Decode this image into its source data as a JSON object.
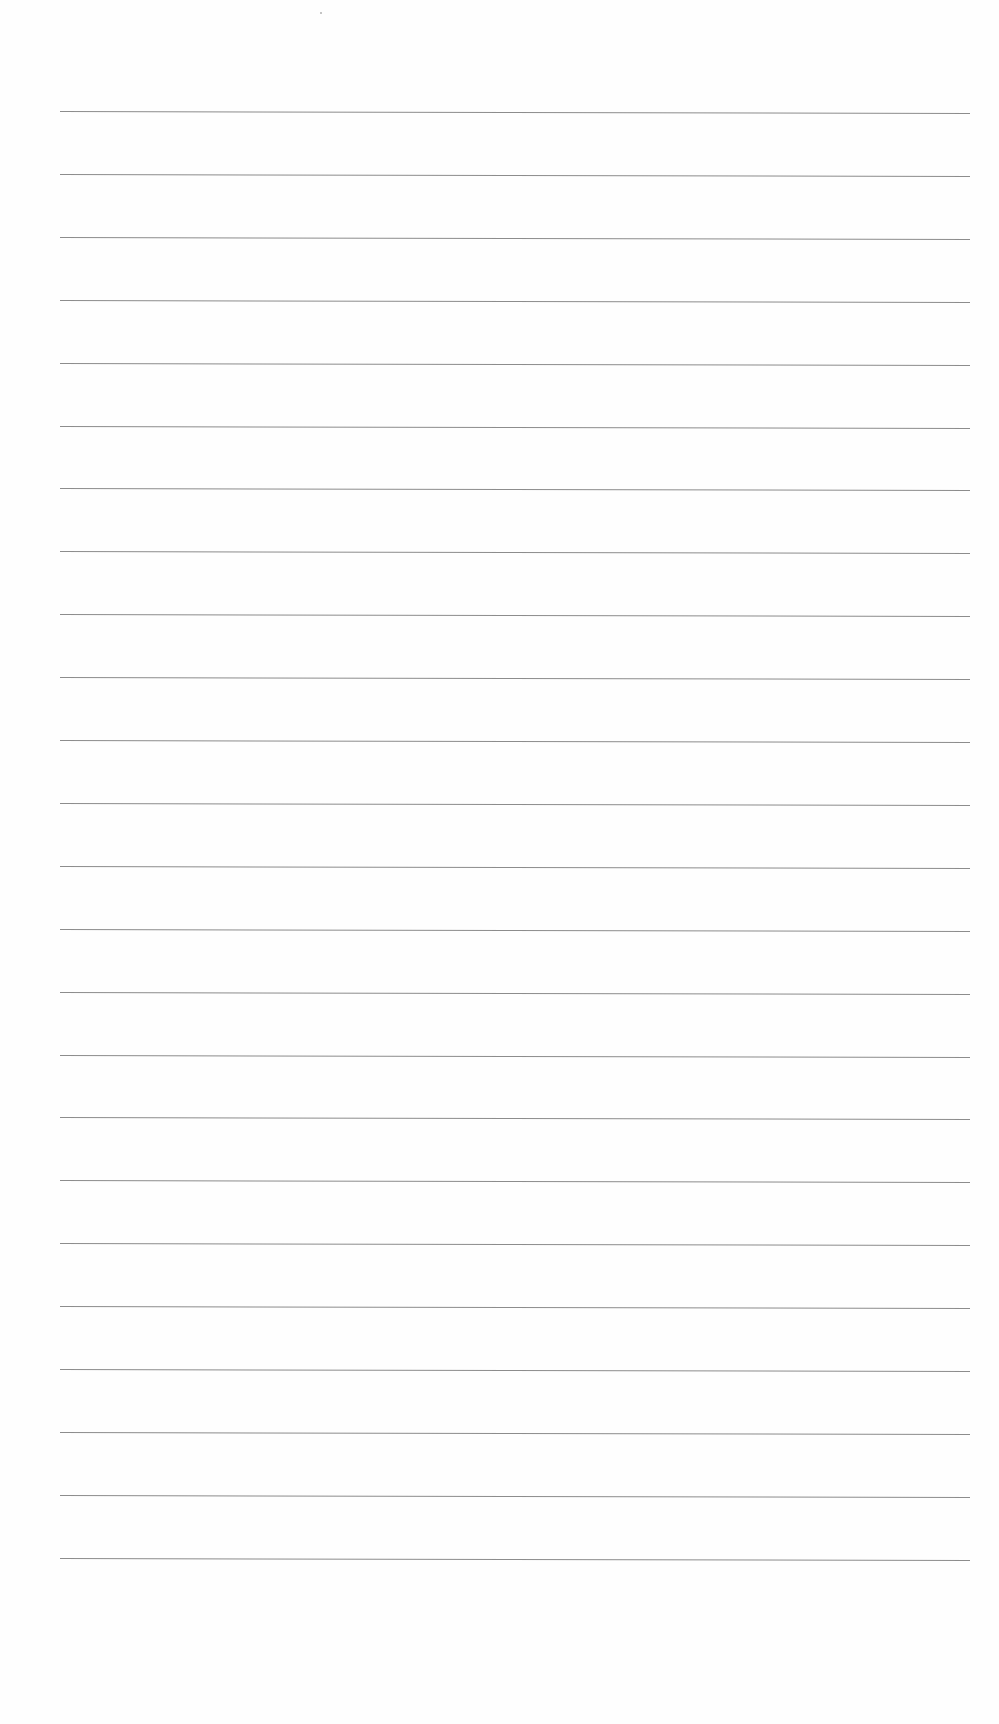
{
  "page": {
    "type": "ruled-paper",
    "background_color": "#fefefe",
    "rule_color": "#8c8c8c",
    "rule_count": 24,
    "rule_left_x": 60,
    "rule_right_x": 970,
    "first_rule_y": 111,
    "rule_spacing": 62.9,
    "text_lines": []
  }
}
